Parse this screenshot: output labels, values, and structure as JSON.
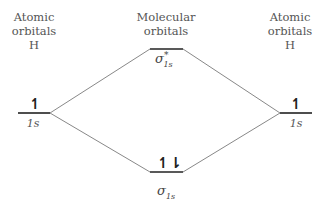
{
  "left": {
    "header_line1": "Atomic",
    "header_line2": "orbitals",
    "atom": "H",
    "orbital_label": "1s",
    "electrons": "↿"
  },
  "center": {
    "header_line1": "Molecular",
    "header_line2": "orbitals",
    "antibonding": {
      "symbol": "σ",
      "sub": "1s",
      "sup": "*",
      "electrons": ""
    },
    "bonding": {
      "symbol": "σ",
      "sub": "1s",
      "electrons": "↿⇂"
    }
  },
  "right": {
    "header_line1": "Atomic",
    "header_line2": "orbitals",
    "atom": "H",
    "orbital_label": "1s",
    "electrons": "↿"
  },
  "colors": {
    "level": "#222222",
    "connector": "#888888",
    "text": "#555555"
  }
}
